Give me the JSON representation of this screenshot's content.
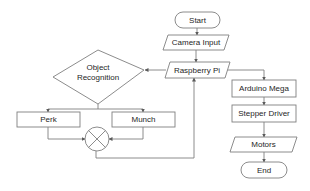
{
  "diagram": {
    "type": "flowchart",
    "nodes": {
      "start": {
        "label": "Start",
        "shape": "terminator"
      },
      "camera_input": {
        "label": "Camera Input",
        "shape": "parallelogram"
      },
      "raspberry_pi": {
        "label": "Raspberry Pi",
        "shape": "parallelogram"
      },
      "object_recognition": {
        "label_line1": "Object",
        "label_line2": "Recognition",
        "shape": "diamond"
      },
      "perk": {
        "label": "Perk",
        "shape": "rectangle"
      },
      "munch": {
        "label": "Munch",
        "shape": "rectangle"
      },
      "merge": {
        "label": "",
        "shape": "summing-junction"
      },
      "arduino_mega": {
        "label": "Arduino Mega",
        "shape": "rectangle"
      },
      "stepper_driver": {
        "label": "Stepper Driver",
        "shape": "rectangle"
      },
      "motors": {
        "label": "Motors",
        "shape": "parallelogram"
      },
      "end": {
        "label": "End",
        "shape": "terminator"
      }
    },
    "edges": [
      [
        "Start",
        "Camera Input"
      ],
      [
        "Camera Input",
        "Raspberry Pi"
      ],
      [
        "Raspberry Pi",
        "Object Recognition"
      ],
      [
        "Object Recognition",
        "Perk"
      ],
      [
        "Object Recognition",
        "Munch"
      ],
      [
        "Perk",
        "merge"
      ],
      [
        "Munch",
        "merge"
      ],
      [
        "merge",
        "Raspberry Pi"
      ],
      [
        "Raspberry Pi",
        "Arduino Mega"
      ],
      [
        "Arduino Mega",
        "Stepper Driver"
      ],
      [
        "Stepper Driver",
        "Motors"
      ],
      [
        "Motors",
        "End"
      ]
    ],
    "colors": {
      "stroke": "#7f7f7f",
      "text": "#262626",
      "fill": "#ffffff"
    }
  }
}
